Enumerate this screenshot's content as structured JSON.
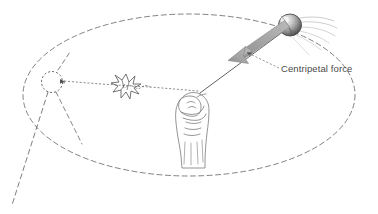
{
  "figure": {
    "background_color": "#ffffff",
    "width": 378,
    "height": 214
  },
  "annotations": {
    "centripetal_force_label": "Centripetal force"
  },
  "colors": {
    "ink": "#555555",
    "path_dash": "#6b6b6b",
    "arrow_fill": "#a8a8a8",
    "arrow_stroke": "#8a8a8a",
    "label_text": "#4a4a4a",
    "ball_dark": "#4a4a4a",
    "ball_light": "#e8e8e8",
    "hand_line": "#777777"
  },
  "elements": {
    "circular_path": {
      "name": "circular-path-ellipse",
      "style": "dashed",
      "center_x": 189,
      "center_y": 95,
      "radius_x": 166,
      "radius_y": 81
    },
    "ball": {
      "name": "ball",
      "center_x": 290,
      "center_y": 25,
      "radius": 11,
      "shading": "stippled-sphere"
    },
    "motion_lines": {
      "name": "motion-blur-lines",
      "count": 6,
      "direction": "trailing-right"
    },
    "string": {
      "name": "string",
      "from_x": 200,
      "from_y": 93,
      "to_x": 283,
      "to_y": 32
    },
    "centripetal_arrow": {
      "name": "centripetal-force-arrow",
      "tail_x": 283,
      "tail_y": 26,
      "tip_x": 228,
      "tip_y": 58,
      "direction": "toward-center"
    },
    "leader_line": {
      "name": "label-leader-line",
      "from_x": 278,
      "from_y": 68,
      "to_x": 248,
      "to_y": 53
    },
    "hand": {
      "name": "hand-fist",
      "x": 175,
      "y": 90,
      "width": 36,
      "height": 76,
      "grip": "holding-string"
    },
    "tangent_dotted_line": {
      "name": "tangent-travel-dotted-line",
      "from_x": 198,
      "from_y": 91,
      "to_x": 62,
      "to_y": 81
    },
    "starburst": {
      "name": "impact-starburst",
      "center_x": 126,
      "center_y": 86,
      "radius": 12,
      "points": 10
    },
    "small_circle": {
      "name": "target-circle",
      "center_x": 52,
      "center_y": 82,
      "radius": 10,
      "style": "dashed"
    },
    "release_line": {
      "name": "release-trajectory-dashed-line",
      "from_x": 48,
      "from_y": 92,
      "to_x": 12,
      "to_y": 205
    },
    "secondary_line": {
      "name": "secondary-dashed-line",
      "from_x": 55,
      "from_y": 92,
      "to_x": 80,
      "to_y": 140
    }
  }
}
